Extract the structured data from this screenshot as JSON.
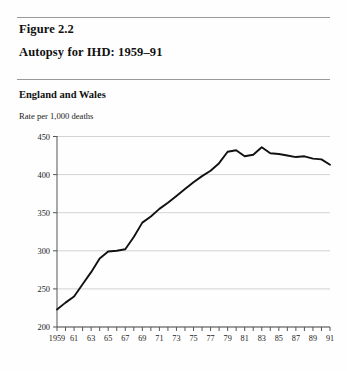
{
  "figure": {
    "number": "Figure 2.2",
    "title": "Autopsy for IHD: 1959–91",
    "region": "England and Wales",
    "unit_label": "Rate per 1,000 deaths"
  },
  "colors": {
    "line": "#111111",
    "grid": "#c8c8c8",
    "axis": "#555555",
    "rule": "#9a9a9a",
    "text": "#111111",
    "background": "#ffffff"
  },
  "chart_data": {
    "type": "line",
    "title": "Autopsy for IHD: 1959–91",
    "subtitle": "England and Wales",
    "xlabel": "",
    "ylabel": "Rate per 1,000 deaths",
    "ylim": [
      200,
      450
    ],
    "xlim": [
      1959,
      1991
    ],
    "yticks": [
      200,
      250,
      300,
      350,
      400,
      450
    ],
    "ytick_labels": [
      "200",
      "250",
      "300",
      "350",
      "400",
      "450"
    ],
    "xticks": [
      1959,
      1960,
      1961,
      1962,
      1963,
      1964,
      1965,
      1966,
      1967,
      1968,
      1969,
      1970,
      1971,
      1972,
      1973,
      1974,
      1975,
      1976,
      1977,
      1978,
      1979,
      1980,
      1981,
      1982,
      1983,
      1984,
      1985,
      1986,
      1987,
      1988,
      1989,
      1990,
      1991
    ],
    "xtick_labels": [
      "1959",
      "",
      "61",
      "",
      "63",
      "",
      "65",
      "",
      "67",
      "",
      "69",
      "",
      "71",
      "",
      "73",
      "",
      "75",
      "",
      "77",
      "",
      "79",
      "",
      "81",
      "",
      "83",
      "",
      "85",
      "",
      "87",
      "",
      "89",
      "",
      "91"
    ],
    "grid": true,
    "grid_axis": "y",
    "legend": false,
    "x": [
      1959,
      1960,
      1961,
      1962,
      1963,
      1964,
      1965,
      1966,
      1967,
      1968,
      1969,
      1970,
      1971,
      1972,
      1973,
      1974,
      1975,
      1976,
      1977,
      1978,
      1979,
      1980,
      1981,
      1982,
      1983,
      1984,
      1985,
      1986,
      1987,
      1988,
      1989,
      1990,
      1991
    ],
    "values": [
      223,
      232,
      240,
      256,
      272,
      290,
      299,
      300,
      302,
      318,
      337,
      345,
      355,
      363,
      372,
      381,
      390,
      398,
      405,
      415,
      430,
      432,
      424,
      426,
      436,
      428,
      427,
      425,
      423,
      424,
      421,
      420,
      413
    ],
    "series": [
      {
        "name": "Autopsy rate for IHD",
        "values": [
          223,
          232,
          240,
          256,
          272,
          290,
          299,
          300,
          302,
          318,
          337,
          345,
          355,
          363,
          372,
          381,
          390,
          398,
          405,
          415,
          430,
          432,
          424,
          426,
          436,
          428,
          427,
          425,
          423,
          424,
          421,
          420,
          413
        ]
      }
    ]
  }
}
